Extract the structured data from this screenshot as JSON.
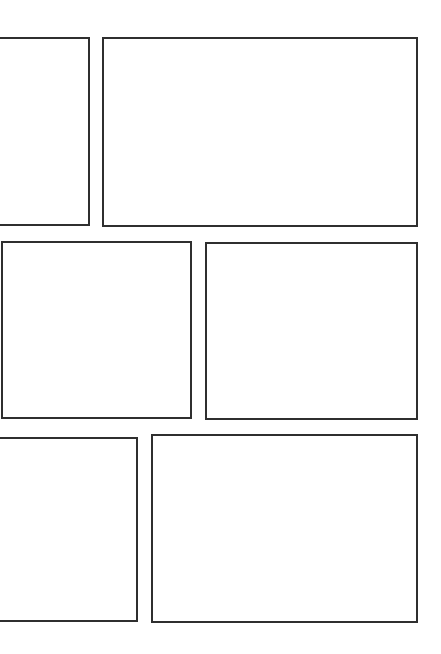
{
  "page": {
    "width": 441,
    "height": 654,
    "background_color": "#ffffff",
    "panel_border_color": "#2f2f2f",
    "panel_border_width_px": 2,
    "panel_fill_color": "#ffffff",
    "rows": 3,
    "panel_count": 6
  },
  "panels": [
    {
      "id": "panel-1",
      "label": "",
      "row": 1,
      "column": 1,
      "x": -8,
      "y": 37,
      "width": 98,
      "height": 189,
      "bleeds_left": true
    },
    {
      "id": "panel-2",
      "label": "",
      "row": 1,
      "column": 2,
      "x": 102,
      "y": 37,
      "width": 316,
      "height": 190,
      "bleeds_left": false
    },
    {
      "id": "panel-3",
      "label": "",
      "row": 2,
      "column": 1,
      "x": 1,
      "y": 241,
      "width": 191,
      "height": 178,
      "bleeds_left": false
    },
    {
      "id": "panel-4",
      "label": "",
      "row": 2,
      "column": 2,
      "x": 205,
      "y": 242,
      "width": 213,
      "height": 178,
      "bleeds_left": false
    },
    {
      "id": "panel-5",
      "label": "",
      "row": 3,
      "column": 1,
      "x": -8,
      "y": 437,
      "width": 146,
      "height": 185,
      "bleeds_left": true
    },
    {
      "id": "panel-6",
      "label": "",
      "row": 3,
      "column": 2,
      "x": 151,
      "y": 434,
      "width": 267,
      "height": 189,
      "bleeds_left": false
    }
  ]
}
